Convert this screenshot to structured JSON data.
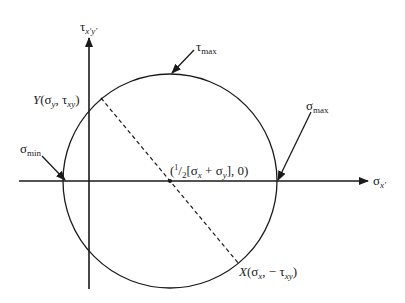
{
  "diagram": {
    "type": "mohrs_circle",
    "colors": {
      "stroke": "#1a1a1a",
      "background": "#ffffff"
    },
    "axes": {
      "horizontal": {
        "label_symbol": "σ",
        "label_sub": "x′"
      },
      "vertical": {
        "label_symbol": "τ",
        "label_sub": "x′y′"
      }
    },
    "labels": {
      "tau_max": {
        "symbol": "τ",
        "sub": "max"
      },
      "sigma_max": {
        "symbol": "σ",
        "sub": "max"
      },
      "sigma_min": {
        "symbol": "σ",
        "sub": "min"
      },
      "point_y": {
        "name": "Y",
        "open": "(",
        "s1": "σ",
        "s1_sub": "y",
        "sep": ", ",
        "s2": "τ",
        "s2_sub": "xy",
        "close": ")"
      },
      "point_x": {
        "name": "X",
        "open": "(",
        "s1": "σ",
        "s1_sub": "x",
        "sep": ", − ",
        "s2": "τ",
        "s2_sub": "xy",
        "close": ")"
      },
      "center": {
        "prefix": "(",
        "frac_num": "1",
        "frac_slash": "/",
        "frac_den": "2",
        "open_bracket": "[",
        "s1": "σ",
        "s1_sub": "x",
        "plus": " + ",
        "s2": "σ",
        "s2_sub": "y",
        "close": "], 0)"
      }
    },
    "geometry": {
      "center": [
        170,
        181
      ],
      "radius": 107,
      "diameter_line": {
        "from": [
          101,
          98
        ],
        "to": [
          239,
          264
        ],
        "style": "dashed"
      }
    }
  }
}
